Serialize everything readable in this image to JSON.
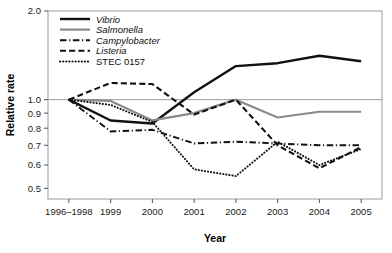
{
  "chart_data": {
    "type": "line",
    "title": "",
    "xlabel": "Year",
    "ylabel": "Relative rate",
    "yscale": "log",
    "ylim": [
      0.46,
      2.0
    ],
    "grid": false,
    "reference_line": 1.0,
    "legend_position": "top-left",
    "categories": [
      "1996–1998",
      "1999",
      "2000",
      "2001",
      "2002",
      "2003",
      "2004",
      "2005"
    ],
    "ytick_labels": [
      "2.0",
      "1.0",
      "0.9",
      "0.8",
      "0.7",
      "0.6",
      "0.5"
    ],
    "ytick_values": [
      2.0,
      1.0,
      0.9,
      0.8,
      0.7,
      0.6,
      0.5
    ],
    "series": [
      {
        "name": "Vibrio",
        "style": "solid",
        "color": "#111111",
        "width": 2.4,
        "italic": true,
        "values": [
          1.0,
          0.85,
          0.83,
          1.06,
          1.3,
          1.33,
          1.41,
          1.35
        ]
      },
      {
        "name": "Salmonella",
        "style": "solid",
        "color": "#8a8a8a",
        "width": 2.2,
        "italic": true,
        "values": [
          1.0,
          0.99,
          0.85,
          0.9,
          1.0,
          0.87,
          0.91,
          0.91
        ]
      },
      {
        "name": "Campylobacter",
        "style": "dashdot",
        "color": "#111111",
        "width": 1.9,
        "italic": true,
        "values": [
          1.0,
          0.78,
          0.79,
          0.71,
          0.72,
          0.71,
          0.7,
          0.7
        ]
      },
      {
        "name": "Listeria",
        "style": "dashed",
        "color": "#111111",
        "width": 2.1,
        "italic": true,
        "values": [
          1.0,
          1.14,
          1.13,
          0.89,
          1.0,
          0.7,
          0.585,
          0.69
        ]
      },
      {
        "name": "STEC 0157",
        "style": "dotted",
        "color": "#111111",
        "width": 2.0,
        "italic": false,
        "values": [
          1.0,
          0.96,
          0.84,
          0.58,
          0.55,
          0.72,
          0.6,
          0.68
        ]
      }
    ]
  }
}
